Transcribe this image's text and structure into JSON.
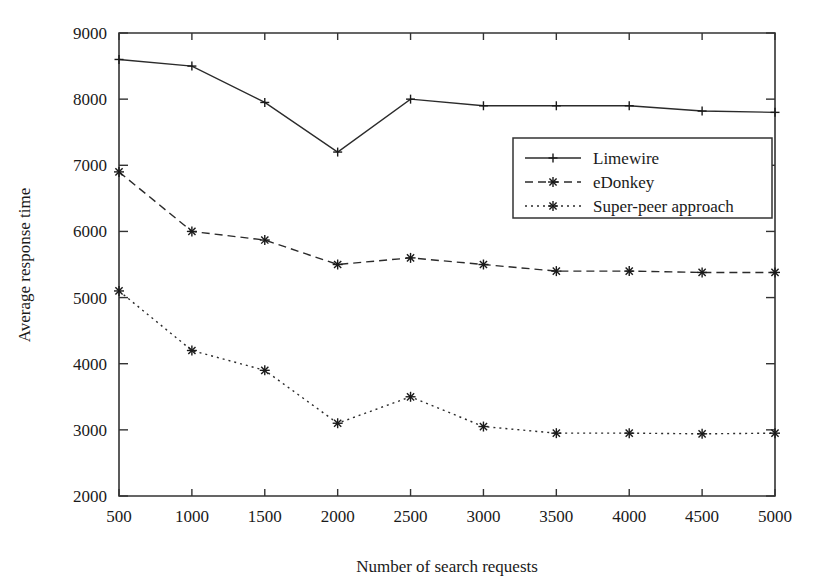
{
  "chart_data": {
    "type": "line",
    "title": "",
    "xlabel": "Number of search requests",
    "ylabel": "Average response time",
    "x": [
      500,
      1000,
      1500,
      2000,
      2500,
      3000,
      3500,
      4000,
      4500,
      5000
    ],
    "xtick_labels": [
      "500",
      "1000",
      "1500",
      "2000",
      "2500",
      "3000",
      "3500",
      "4000",
      "4500",
      "5000"
    ],
    "ytick_labels": [
      "2000",
      "3000",
      "4000",
      "5000",
      "6000",
      "7000",
      "8000",
      "9000"
    ],
    "yticks": [
      2000,
      3000,
      4000,
      5000,
      6000,
      7000,
      8000,
      9000
    ],
    "xlim": [
      500,
      5000
    ],
    "ylim": [
      2000,
      9000
    ],
    "grid": false,
    "legend_position": "center-right",
    "series": [
      {
        "name": "Limewire",
        "marker": "plus",
        "dash": "solid",
        "values": [
          8600,
          8500,
          7950,
          7200,
          8000,
          7900,
          7900,
          7900,
          7820,
          7800
        ]
      },
      {
        "name": "eDonkey",
        "marker": "star",
        "dash": "dashed",
        "values": [
          6900,
          6000,
          5870,
          5500,
          5600,
          5500,
          5400,
          5400,
          5380,
          5380
        ]
      },
      {
        "name": "Super-peer approach",
        "marker": "star",
        "dash": "dotted",
        "values": [
          5100,
          4200,
          3900,
          3100,
          3500,
          3050,
          2950,
          2950,
          2940,
          2950
        ]
      }
    ],
    "colors": {
      "axis": "#333333",
      "series": "#2b2b2b",
      "background": "#ffffff"
    }
  }
}
